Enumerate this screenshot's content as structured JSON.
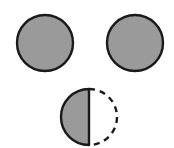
{
  "figure": {
    "canvas": {
      "width": 174,
      "height": 148,
      "background_color": "#ffffff"
    },
    "style": {
      "fill_color": "#9a9a9a",
      "stroke_color": "#1a1a1a",
      "stroke_width": 2.4,
      "dash_pattern": "6 5",
      "dash_stroke_width": 2.4
    },
    "shapes": [
      {
        "id": "circle-top-left",
        "name": "top-left-circle",
        "kind": "full-circle",
        "cx": 45,
        "cy": 43,
        "r": 28,
        "fill": "#9a9a9a",
        "stroke": "#1a1a1a",
        "outline": "solid"
      },
      {
        "id": "circle-top-right",
        "name": "top-right-circle",
        "kind": "full-circle",
        "cx": 135,
        "cy": 43,
        "r": 28,
        "fill": "#9a9a9a",
        "stroke": "#1a1a1a",
        "outline": "solid"
      },
      {
        "id": "circle-bottom",
        "name": "bottom-half-shaded-circle",
        "kind": "half-shaded-circle",
        "cx": 89,
        "cy": 117,
        "r": 28,
        "shaded_half": "left",
        "shaded_fill": "#9a9a9a",
        "shaded_outline": "solid",
        "unshaded_half": "right",
        "unshaded_fill": "none",
        "unshaded_outline": "dashed",
        "stroke": "#1a1a1a"
      }
    ]
  }
}
